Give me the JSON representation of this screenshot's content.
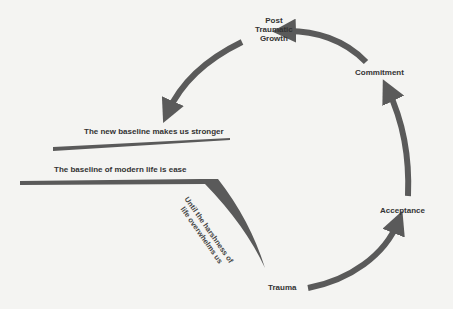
{
  "diagram": {
    "nodes": {
      "post_traumatic_growth": [
        "Post",
        "Traumatic",
        "Growth"
      ],
      "commitment": "Commitment",
      "acceptance": "Acceptance",
      "trauma": "Trauma"
    },
    "baselines": {
      "new": "The new baseline makes us stronger",
      "modern": "The baseline of modern life is ease"
    },
    "descent": [
      "Until the harshness of",
      "life overwhelms us"
    ],
    "colors": {
      "arrow": "#5a5a5a",
      "text": "#333333",
      "background": "#f4f4f2"
    }
  }
}
